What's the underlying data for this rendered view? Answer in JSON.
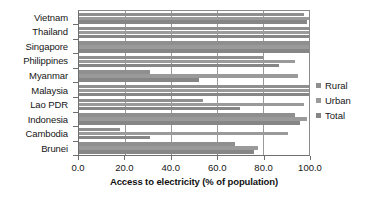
{
  "chart_data": {
    "type": "bar",
    "orientation": "horizontal",
    "title": "",
    "xlabel": "Access to electricity (% of population)",
    "ylabel": "",
    "xlim": [
      0,
      100
    ],
    "xticks": [
      "0.0",
      "20.0",
      "40.0",
      "60.0",
      "80.0",
      "100.0"
    ],
    "xtick_values": [
      0,
      20,
      40,
      60,
      80,
      100
    ],
    "grid": true,
    "grid_axis": "x",
    "legend_position": "right",
    "categories": [
      "Vietnam",
      "Thailand",
      "Singapore",
      "Philippines",
      "Myanmar",
      "Malaysia",
      "Lao PDR",
      "Indonesia",
      "Cambodia",
      "Brunei"
    ],
    "series": [
      {
        "name": "Rural",
        "color": "#8f8f8f",
        "values": [
          98,
          100,
          100,
          80,
          31,
          100,
          54,
          94,
          18,
          68
        ]
      },
      {
        "name": "Urban",
        "color": "#9a9a9a",
        "values": [
          100,
          100,
          100,
          94,
          95,
          100,
          98,
          99,
          91,
          78
        ]
      },
      {
        "name": "Total",
        "color": "#868686",
        "values": [
          99,
          100,
          100,
          87,
          52,
          100,
          70,
          96,
          31,
          76
        ]
      }
    ]
  },
  "legend": {
    "items": [
      {
        "label": "Rural",
        "color": "#8f8f8f"
      },
      {
        "label": "Urban",
        "color": "#9a9a9a"
      },
      {
        "label": "Total",
        "color": "#868686"
      }
    ]
  },
  "colors": {
    "background": "#ffffff",
    "axis": "#6e6e6e",
    "gridline": "#9a9a9a",
    "text": "#161616"
  }
}
